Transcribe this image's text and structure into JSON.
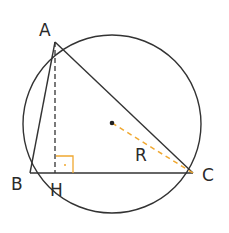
{
  "diagram": {
    "type": "geometry",
    "points": {
      "A": {
        "label": "A",
        "x": 55,
        "y": 42
      },
      "B": {
        "label": "B",
        "x": 30,
        "y": 173
      },
      "C": {
        "label": "C",
        "x": 193,
        "y": 173
      },
      "H": {
        "label": "H",
        "x": 55,
        "y": 173
      },
      "O": {
        "label": "",
        "x": 112,
        "y": 123
      }
    },
    "circle": {
      "cx": 112,
      "cy": 124,
      "r": 89
    },
    "radius_label": "R",
    "colors": {
      "stroke": "#333333",
      "accent": "#f0a830"
    }
  }
}
